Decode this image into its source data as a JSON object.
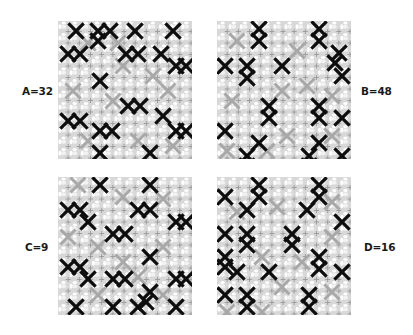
{
  "figure": {
    "background": "#ffffff",
    "lattice": {
      "cell_px": 11.2,
      "cells_per_side": 12,
      "base_color": "#d8d8d8",
      "hole_color": "#ffffff",
      "cross_color": "#9a9a9a",
      "gray_mark_color": "#a8a8a8",
      "black_mark_color": "#0d0d0d"
    },
    "panels": [
      {
        "id": "A",
        "label": "A=32",
        "value": 32,
        "position": "top-left",
        "marks_black": [
          [
            18,
            10
          ],
          [
            40,
            10
          ],
          [
            40,
            20
          ],
          [
            52,
            10
          ],
          [
            77,
            10
          ],
          [
            115,
            10
          ],
          [
            10,
            33
          ],
          [
            22,
            33
          ],
          [
            68,
            33
          ],
          [
            80,
            33
          ],
          [
            103,
            33
          ],
          [
            118,
            45
          ],
          [
            128,
            45
          ],
          [
            42,
            60
          ],
          [
            70,
            85
          ],
          [
            82,
            85
          ],
          [
            10,
            100
          ],
          [
            22,
            100
          ],
          [
            105,
            95
          ],
          [
            42,
            110
          ],
          [
            54,
            110
          ],
          [
            118,
            110
          ],
          [
            128,
            110
          ],
          [
            42,
            132
          ],
          [
            92,
            132
          ]
        ],
        "marks_gray": [
          [
            30,
            22
          ],
          [
            60,
            22
          ],
          [
            95,
            55
          ],
          [
            15,
            70
          ],
          [
            55,
            80
          ],
          [
            110,
            70
          ],
          [
            30,
            120
          ],
          [
            80,
            120
          ],
          [
            115,
            125
          ],
          [
            65,
            45
          ]
        ]
      },
      {
        "id": "B",
        "label": "B=48",
        "value": 48,
        "position": "top-right",
        "marks_black": [
          [
            42,
            8
          ],
          [
            42,
            20
          ],
          [
            102,
            8
          ],
          [
            102,
            20
          ],
          [
            122,
            32
          ],
          [
            8,
            45
          ],
          [
            30,
            45
          ],
          [
            30,
            57
          ],
          [
            65,
            45
          ],
          [
            118,
            42
          ],
          [
            125,
            55
          ],
          [
            52,
            85
          ],
          [
            52,
            97
          ],
          [
            102,
            85
          ],
          [
            102,
            97
          ],
          [
            125,
            97
          ],
          [
            8,
            110
          ],
          [
            42,
            122
          ],
          [
            30,
            135
          ],
          [
            30,
            145
          ],
          [
            102,
            122
          ],
          [
            92,
            135
          ],
          [
            92,
            145
          ],
          [
            125,
            135
          ]
        ],
        "marks_gray": [
          [
            20,
            20
          ],
          [
            80,
            30
          ],
          [
            65,
            70
          ],
          [
            15,
            80
          ],
          [
            90,
            65
          ],
          [
            115,
            75
          ],
          [
            70,
            115
          ],
          [
            115,
            115
          ],
          [
            50,
            130
          ],
          [
            10,
            130
          ]
        ]
      },
      {
        "id": "C",
        "label": "C=9",
        "value": 9,
        "position": "bottom-left",
        "marks_black": [
          [
            42,
            8
          ],
          [
            92,
            8
          ],
          [
            10,
            33
          ],
          [
            22,
            33
          ],
          [
            30,
            45
          ],
          [
            80,
            33
          ],
          [
            92,
            33
          ],
          [
            118,
            45
          ],
          [
            128,
            45
          ],
          [
            55,
            57
          ],
          [
            67,
            57
          ],
          [
            92,
            80
          ],
          [
            10,
            90
          ],
          [
            22,
            90
          ],
          [
            30,
            102
          ],
          [
            55,
            102
          ],
          [
            67,
            102
          ],
          [
            118,
            102
          ],
          [
            128,
            102
          ],
          [
            92,
            115
          ],
          [
            88,
            125
          ],
          [
            18,
            130
          ],
          [
            55,
            130
          ],
          [
            80,
            130
          ],
          [
            118,
            130
          ]
        ],
        "marks_gray": [
          [
            20,
            8
          ],
          [
            65,
            20
          ],
          [
            105,
            22
          ],
          [
            40,
            70
          ],
          [
            105,
            70
          ],
          [
            10,
            60
          ],
          [
            65,
            85
          ],
          [
            40,
            118
          ],
          [
            105,
            118
          ],
          [
            80,
            100
          ]
        ]
      },
      {
        "id": "D",
        "label": "D=16",
        "value": 16,
        "position": "bottom-right",
        "marks_black": [
          [
            42,
            8
          ],
          [
            42,
            20
          ],
          [
            102,
            8
          ],
          [
            102,
            20
          ],
          [
            8,
            20
          ],
          [
            30,
            33
          ],
          [
            90,
            33
          ],
          [
            125,
            45
          ],
          [
            8,
            57
          ],
          [
            30,
            57
          ],
          [
            30,
            68
          ],
          [
            75,
            57
          ],
          [
            75,
            68
          ],
          [
            8,
            80
          ],
          [
            8,
            90
          ],
          [
            20,
            95
          ],
          [
            52,
            95
          ],
          [
            102,
            80
          ],
          [
            102,
            92
          ],
          [
            125,
            95
          ],
          [
            8,
            118
          ],
          [
            30,
            118
          ],
          [
            30,
            130
          ],
          [
            92,
            118
          ],
          [
            92,
            130
          ]
        ],
        "marks_gray": [
          [
            20,
            35
          ],
          [
            60,
            30
          ],
          [
            115,
            25
          ],
          [
            45,
            80
          ],
          [
            85,
            85
          ],
          [
            115,
            60
          ],
          [
            65,
            110
          ],
          [
            115,
            115
          ],
          [
            45,
            135
          ],
          [
            10,
            135
          ]
        ]
      }
    ]
  }
}
